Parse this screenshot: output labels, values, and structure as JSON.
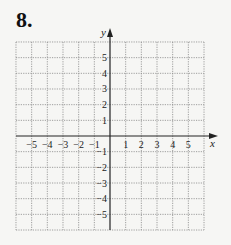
{
  "problem": {
    "number": "8."
  },
  "grid": {
    "x_min": -6,
    "x_max": 6,
    "y_min": -6,
    "y_max": 6,
    "origin_px": [
      110,
      136
    ],
    "cell_px": 15.67,
    "grid_color": "#888888",
    "axis_color": "#222222"
  },
  "axes": {
    "x_label": "x",
    "y_label": "y",
    "x_ticks": [
      "-5",
      "-4",
      "-3",
      "-2",
      "-1",
      "1",
      "2",
      "3",
      "4",
      "5"
    ],
    "y_ticks": [
      "5",
      "4",
      "3",
      "2",
      "1",
      "-1",
      "-2",
      "-3",
      "-4",
      "-5"
    ]
  },
  "chart_data": {
    "type": "scatter",
    "title": "8.",
    "xlabel": "x",
    "ylabel": "y",
    "xlim": [
      -6,
      6
    ],
    "ylim": [
      -6,
      6
    ],
    "x_ticks": [
      -5,
      -4,
      -3,
      -2,
      -1,
      1,
      2,
      3,
      4,
      5
    ],
    "y_ticks": [
      -5,
      -4,
      -3,
      -2,
      -1,
      1,
      2,
      3,
      4,
      5
    ],
    "grid": true,
    "series": []
  }
}
